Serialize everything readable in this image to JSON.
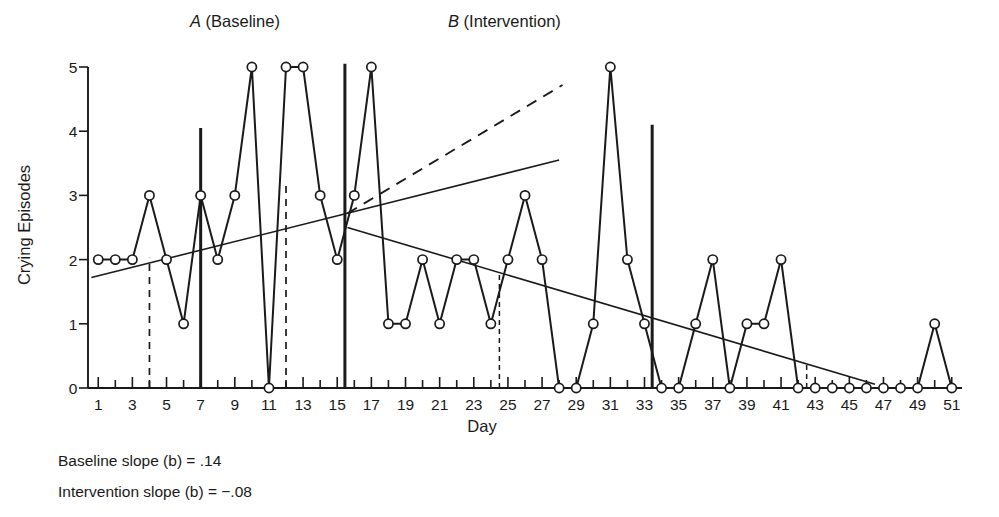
{
  "figure": {
    "phase_a_label_italic": "A",
    "phase_a_label_rest": " (Baseline)",
    "phase_b_label_italic": "B",
    "phase_b_label_rest": " (Intervention)",
    "y_axis_title": "Crying Episodes",
    "x_axis_title": "Day",
    "caption_line_1": "Baseline slope (b) = .14",
    "caption_line_2": "Intervention slope (b) = −.08",
    "line_color": "#1a1a1a",
    "background_color": "#ffffff"
  },
  "chart_data": {
    "type": "line",
    "title": "",
    "xlabel": "Day",
    "ylabel": "Crying Episodes",
    "xlim": [
      0.4,
      51.6
    ],
    "ylim": [
      0,
      5
    ],
    "grid": false,
    "legend": "none",
    "x_tick_labels": [
      "1",
      "3",
      "5",
      "7",
      "9",
      "11",
      "13",
      "15",
      "17",
      "19",
      "21",
      "23",
      "25",
      "27",
      "29",
      "31",
      "33",
      "35",
      "37",
      "39",
      "41",
      "43",
      "45",
      "47",
      "49",
      "51"
    ],
    "x_tick_values": [
      1,
      3,
      5,
      7,
      9,
      11,
      13,
      15,
      17,
      19,
      21,
      23,
      25,
      27,
      29,
      31,
      33,
      35,
      37,
      39,
      41,
      43,
      45,
      47,
      49,
      51
    ],
    "x_minor_ticks": [
      2,
      4,
      6,
      8,
      10,
      12,
      14,
      16,
      18,
      20,
      22,
      24,
      26,
      28,
      30,
      32,
      34,
      36,
      38,
      40,
      42,
      44,
      46,
      48,
      50
    ],
    "y_tick_labels": [
      "0",
      "1",
      "2",
      "3",
      "4",
      "5"
    ],
    "y_tick_values": [
      0,
      1,
      2,
      3,
      4,
      5
    ],
    "x": [
      1,
      2,
      3,
      4,
      5,
      6,
      7,
      8,
      9,
      10,
      11,
      12,
      13,
      14,
      15,
      16,
      17,
      18,
      19,
      20,
      21,
      22,
      23,
      24,
      25,
      26,
      27,
      28,
      29,
      30,
      31,
      32,
      33,
      34,
      35,
      36,
      37,
      38,
      39,
      40,
      41,
      42,
      43,
      44,
      45,
      46,
      47,
      48,
      49,
      50,
      51
    ],
    "values": [
      2,
      2,
      2,
      3,
      2,
      1,
      3,
      2,
      3,
      5,
      0,
      5,
      5,
      3,
      2,
      3,
      5,
      1,
      1,
      2,
      1,
      2,
      2,
      1,
      2,
      3,
      2,
      0,
      0,
      1,
      5,
      2,
      1,
      0,
      0,
      1,
      2,
      0,
      1,
      1,
      2,
      0,
      0,
      0,
      0,
      0,
      0,
      0,
      0,
      1,
      0
    ],
    "series_name": "Crying Episodes",
    "trend_lines": [
      {
        "name": "baseline-trend",
        "style": "solid",
        "x1": 0.6,
        "y1": 1.72,
        "x2": 28.0,
        "y2": 3.55,
        "slope": 0.14
      },
      {
        "name": "baseline-trend-extension",
        "style": "dashed",
        "x1": 15.6,
        "y1": 2.72,
        "x2": 28.2,
        "y2": 4.72,
        "slope": 0.14
      },
      {
        "name": "intervention-trend",
        "style": "solid",
        "x1": 15.6,
        "y1": 2.5,
        "x2": 46.5,
        "y2": 0.06,
        "slope": -0.08
      }
    ],
    "phase_dividers": [
      {
        "name": "phase-divider-day7",
        "x": 7.0,
        "y_top": 4.05,
        "y_bottom": 0
      },
      {
        "name": "phase-divider-day15",
        "x": 15.45,
        "y_top": 5.05,
        "y_bottom": 0
      },
      {
        "name": "phase-divider-day33",
        "x": 33.45,
        "y_top": 4.1,
        "y_bottom": 0
      }
    ],
    "guide_lines": [
      {
        "name": "guide-day4",
        "x": 4.0,
        "y_top": 2.03,
        "y_bottom": 0,
        "weight": "normal"
      },
      {
        "name": "guide-day12",
        "x": 12.0,
        "y_top": 3.23,
        "y_bottom": 0,
        "weight": "normal"
      },
      {
        "name": "guide-day24-5",
        "x": 24.5,
        "y_top": 1.8,
        "y_bottom": 0,
        "weight": "thin"
      },
      {
        "name": "guide-day42-5",
        "x": 42.5,
        "y_top": 0.4,
        "y_bottom": 0,
        "weight": "thin"
      }
    ]
  }
}
